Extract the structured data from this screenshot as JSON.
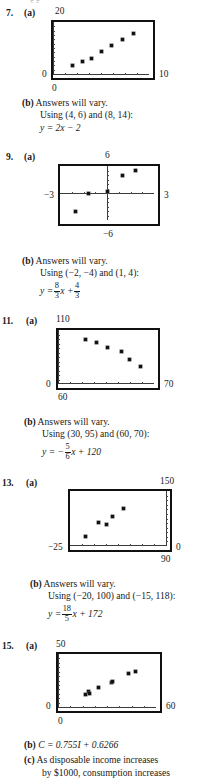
{
  "page": {
    "clipped_top_text": "5    5"
  },
  "problems": [
    {
      "number": "7.",
      "part_a_label": "(a)",
      "graph": {
        "top_label": "20",
        "bottom_label": "0",
        "left_label": "0",
        "right_label": "10",
        "xmin": 0,
        "xmax": 10,
        "ymin": 0,
        "ymax": 20
      },
      "lines": [
        {
          "bold": "(b)",
          "text": "Answers will vary."
        },
        {
          "bold": "",
          "text": "Using (4, 6) and (8, 14):"
        }
      ],
      "equation_plain": "y = 2x − 2"
    },
    {
      "number": "9.",
      "part_a_label": "(a)",
      "graph": {
        "top_label": "6",
        "bottom_label": "−6",
        "left_label": "−3",
        "right_label": "3",
        "xmin": -3,
        "xmax": 3,
        "ymin": -6,
        "ymax": 6
      },
      "lines": [
        {
          "bold": "(b)",
          "text": "Answers will vary."
        },
        {
          "bold": "",
          "text": "Using (−2, −4) and (1, 4):"
        }
      ],
      "equation_fraction": {
        "lhs": "y =",
        "num1": "8",
        "den1": "3",
        "mid": "x +",
        "num2": "4",
        "den2": "3"
      }
    },
    {
      "number": "11.",
      "part_a_label": "(a)",
      "graph": {
        "top_label": "110",
        "bottom_label": "60",
        "left_label": "0",
        "right_label": "70",
        "xmin": 0,
        "xmax": 70,
        "ymin": 60,
        "ymax": 110
      },
      "lines": [
        {
          "bold": "(b)",
          "text": "Answers will vary."
        },
        {
          "bold": "",
          "text": "Using (30, 95) and (60, 70):"
        }
      ],
      "equation_fraction": {
        "lhs": "y = −",
        "num1": "5",
        "den1": "6",
        "mid": "x + 120",
        "num2": "",
        "den2": ""
      }
    },
    {
      "number": "13.",
      "part_a_label": "(a)",
      "graph": {
        "top_label": "150",
        "bottom_label": "90",
        "left_label": "−25",
        "right_label": "0",
        "xmin": -25,
        "xmax": 0,
        "ymin": 90,
        "ymax": 150
      },
      "lines": [
        {
          "bold": "(b)",
          "text": "Answers will vary."
        },
        {
          "bold": "",
          "text": "Using (−20, 100) and (−15, 118):"
        }
      ],
      "equation_fraction": {
        "lhs": "y =",
        "num1": "18",
        "den1": "5",
        "mid": "x + 172",
        "num2": "",
        "den2": ""
      }
    },
    {
      "number": "15.",
      "part_a_label": "(a)",
      "graph": {
        "top_label": "50",
        "bottom_label": "0",
        "left_label": "0",
        "right_label": "60",
        "xmin": 0,
        "xmax": 60,
        "ymin": 0,
        "ymax": 50
      },
      "lines": [
        {
          "bold": "(b)",
          "text": "C = 0.755I + 0.6266"
        },
        {
          "bold": "(c)",
          "text": "As disposable income increases"
        },
        {
          "bold": "",
          "text": "by $1000, consumption increases"
        }
      ]
    }
  ],
  "chart_data": [
    {
      "type": "scatter",
      "title": "7. (a)",
      "xlabel": "",
      "ylabel": "",
      "xlim": [
        0,
        10
      ],
      "ylim": [
        0,
        20
      ],
      "tick_labels": {
        "left": "0",
        "right": "10",
        "top": "20",
        "bottom": "0"
      },
      "grid": false,
      "points": [
        {
          "x": 2.0,
          "y": 3.1
        },
        {
          "x": 3.1,
          "y": 5.0
        },
        {
          "x": 4.0,
          "y": 6.1
        },
        {
          "x": 5.1,
          "y": 8.8
        },
        {
          "x": 6.1,
          "y": 11.1
        },
        {
          "x": 7.2,
          "y": 13.3
        },
        {
          "x": 8.4,
          "y": 15.6
        }
      ]
    },
    {
      "type": "scatter",
      "title": "9. (a)",
      "xlabel": "",
      "ylabel": "",
      "xlim": [
        -3,
        3
      ],
      "ylim": [
        -6,
        6
      ],
      "tick_labels": {
        "left": "−3",
        "right": "3",
        "top": "6",
        "bottom": "−6"
      },
      "grid": false,
      "axes_centered": true,
      "points": [
        {
          "x": -2.0,
          "y": -4.0
        },
        {
          "x": -1.15,
          "y": 0.0
        },
        {
          "x": 0.0,
          "y": 0.35
        },
        {
          "x": 1.0,
          "y": 4.0
        },
        {
          "x": 1.85,
          "y": 5.0
        }
      ]
    },
    {
      "type": "scatter",
      "title": "11. (a)",
      "xlabel": "",
      "ylabel": "",
      "xlim": [
        0,
        70
      ],
      "ylim": [
        60,
        110
      ],
      "tick_labels": {
        "left": "0",
        "right": "70",
        "top": "110",
        "bottom": "60"
      },
      "grid": false,
      "points": [
        {
          "x": 20,
          "y": 101
        },
        {
          "x": 28,
          "y": 98
        },
        {
          "x": 36,
          "y": 94
        },
        {
          "x": 46,
          "y": 90
        },
        {
          "x": 52,
          "y": 83
        },
        {
          "x": 60,
          "y": 76
        }
      ]
    },
    {
      "type": "scatter",
      "title": "13. (a)",
      "xlabel": "",
      "ylabel": "",
      "xlim": [
        -25,
        0
      ],
      "ylim": [
        90,
        150
      ],
      "tick_labels": {
        "left": "−25",
        "right": "0",
        "top": "150",
        "bottom": "90"
      },
      "grid": false,
      "points": [
        {
          "x": -21.0,
          "y": 100
        },
        {
          "x": -17.5,
          "y": 116
        },
        {
          "x": -15.5,
          "y": 113
        },
        {
          "x": -14.0,
          "y": 122
        },
        {
          "x": -11.0,
          "y": 131
        }
      ]
    },
    {
      "type": "scatter",
      "title": "15. (a)",
      "xlabel": "",
      "ylabel": "",
      "xlim": [
        0,
        60
      ],
      "ylim": [
        0,
        50
      ],
      "tick_labels": {
        "left": "0",
        "right": "60",
        "top": "50",
        "bottom": "0"
      },
      "grid": false,
      "points": [
        {
          "x": 17.0,
          "y": 11.5
        },
        {
          "x": 18.5,
          "y": 14.5
        },
        {
          "x": 19.0,
          "y": 13.0
        },
        {
          "x": 25.0,
          "y": 18.0
        },
        {
          "x": 32.5,
          "y": 23.5
        },
        {
          "x": 33.5,
          "y": 24.5
        },
        {
          "x": 43.0,
          "y": 32.0
        },
        {
          "x": 47.5,
          "y": 33.5
        }
      ]
    }
  ]
}
